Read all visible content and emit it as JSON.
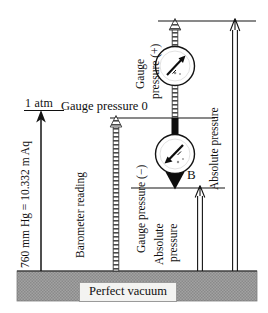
{
  "figure": {
    "width": 268,
    "height": 313,
    "background_color": "#ffffff"
  },
  "labels": {
    "one_atm": "1 atm",
    "mm_hg_equiv": "760 mm Hg = 10.332 m Aq",
    "gauge_pressure_zero": "Gauge pressure 0",
    "barometer_reading": "Barometer reading",
    "gauge_pressure_plus_line1": "Gauge",
    "gauge_pressure_plus_line2": "pressure (+)",
    "gauge_pressure_minus": "Gauge pressure (−)",
    "absolute_pressure_mid_line1": "Absolute",
    "absolute_pressure_mid_line2": "pressure",
    "absolute_pressure_right": "Absolute pressure",
    "point_b": "B",
    "perfect_vacuum": "Perfect vacuum"
  },
  "levels": {
    "top_line_label": "upper pressure level line",
    "gauge_zero_line_label": "atmospheric / gauge zero line",
    "b_line_label": "point B level line",
    "vacuum_line_label": "perfect vacuum baseline"
  },
  "arrows": {
    "atm_arrow": "1 atm magnitude arrow",
    "barometer_arrow": "barometer reading hatched arrow",
    "gauge_positive_arrow": "positive gauge pressure hatched arrow",
    "gauge_negative_arrow": "negative gauge pressure solid arrow",
    "absolute_mid_arrow": "absolute pressure at B outline arrow",
    "absolute_right_arrow": "absolute pressure outline arrow"
  },
  "gauges": {
    "upper_dial": "pressure gauge dial reading positive",
    "lower_dial": "pressure gauge dial reading negative"
  },
  "colors": {
    "ink": "#101010",
    "vacuum_band": "#9d9d9d",
    "vacuum_label_bg": "#f3f3f1",
    "hatch": "#6d6d6d"
  }
}
